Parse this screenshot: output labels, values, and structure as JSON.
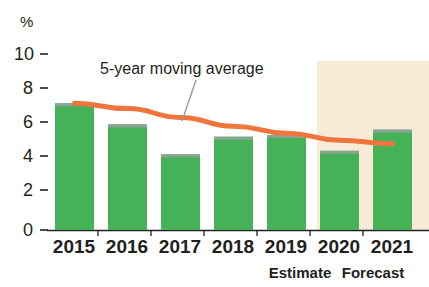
{
  "chart_data": {
    "type": "bar",
    "title": "",
    "xlabel": "",
    "ylabel": "%",
    "ylim": [
      0,
      10
    ],
    "yticks": [
      0,
      2,
      4,
      6,
      8,
      10
    ],
    "ytick_labels": [
      "0",
      "2",
      "4",
      "6",
      "8",
      "10"
    ],
    "grid": false,
    "legend_position": "annotation",
    "categories": [
      "2015",
      "2016",
      "2017",
      "2018",
      "2019",
      "2020",
      "2021"
    ],
    "series": [
      {
        "name": "Annual value",
        "type": "bar",
        "color": "#46b257",
        "values": [
          7.2,
          6.0,
          4.3,
          5.3,
          5.4,
          4.5,
          5.7
        ]
      },
      {
        "name": "5-year moving average",
        "type": "line",
        "color": "#f0753c",
        "values": [
          7.2,
          6.9,
          6.4,
          5.9,
          5.5,
          5.1,
          4.9
        ]
      }
    ],
    "annotations": [
      {
        "text": "5-year moving average",
        "target_category": "2018"
      }
    ],
    "category_notes": [
      {
        "category": "2020",
        "note": "Estimate"
      },
      {
        "category": "2021",
        "note": "Forecast"
      }
    ],
    "shaded_region": {
      "label": "Estimate / Forecast period",
      "from_category": "2020",
      "to_category": "2021",
      "color": "#f7ead6"
    }
  },
  "axis": {
    "unit_label": "%",
    "tick_labels": [
      "10",
      "8",
      "6",
      "4",
      "2",
      "0"
    ]
  },
  "x_labels": [
    "2015",
    "2016",
    "2017",
    "2018",
    "2019",
    "2020",
    "2021"
  ],
  "sub_labels": [
    "Estimate",
    "Forecast"
  ],
  "annotation": {
    "moving_average": "5-year moving average"
  },
  "colors": {
    "bar": "#46b257",
    "bar_top_shade": "#8fa79a",
    "line": "#f0753c",
    "shaded_band": "#f7ead6",
    "axis": "#231f20",
    "background": "#ffffff"
  }
}
